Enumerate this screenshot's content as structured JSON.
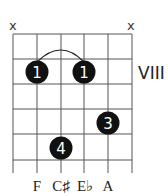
{
  "chord_diagram": {
    "position_label": "VIII",
    "muted_strings": [
      {
        "string": 1,
        "symbol": "x"
      },
      {
        "string": 6,
        "symbol": "x"
      }
    ],
    "fingers": [
      {
        "label": "1",
        "string": 2,
        "fret": 2
      },
      {
        "label": "1",
        "string": 4,
        "fret": 2
      },
      {
        "label": "3",
        "string": 5,
        "fret": 4
      },
      {
        "label": "4",
        "string": 3,
        "fret": 5
      }
    ],
    "barre": {
      "from_string": 2,
      "to_string": 4,
      "fret": 2
    },
    "note_labels": [
      "F",
      "C♯",
      "E♭",
      "A"
    ],
    "note_labels_strings": [
      2,
      3,
      4,
      5
    ]
  }
}
